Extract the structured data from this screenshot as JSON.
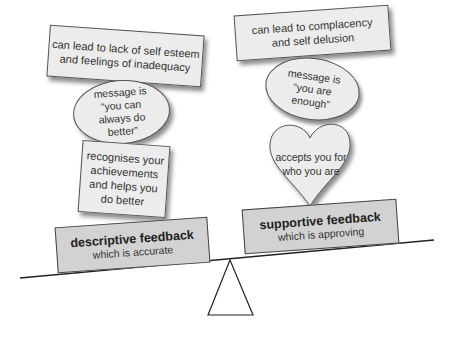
{
  "left": {
    "top_note": "can lead to lack of self esteem and feelings of inadequacy",
    "message_oval": "message is “you can always do better”",
    "lower_note": "recognises your achievements and helps you do better",
    "base_title": "descriptive feedback",
    "base_subtitle": "which is accurate"
  },
  "right": {
    "top_note": "can lead to complacency and self delusion",
    "message_oval": "message is “you are enough”",
    "heart": "accepts you for who you are",
    "base_title": "supportive feedback",
    "base_subtitle": "which is approving"
  },
  "colors": {
    "note_fill": "#ececec",
    "base_fill": "#d2d2d2",
    "outline": "#444444"
  }
}
